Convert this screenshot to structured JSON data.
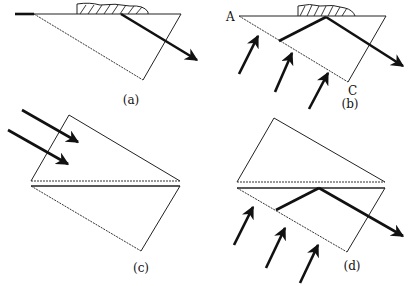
{
  "figure": {
    "panels": [
      {
        "id": "a",
        "label": "(a)"
      },
      {
        "id": "b",
        "label": "(b)",
        "vertex_labels": [
          "A",
          "C"
        ]
      },
      {
        "id": "c",
        "label": "(c)"
      },
      {
        "id": "d",
        "label": "(d)"
      }
    ]
  },
  "colors": {
    "ink": "#111111",
    "background": "#ffffff"
  }
}
